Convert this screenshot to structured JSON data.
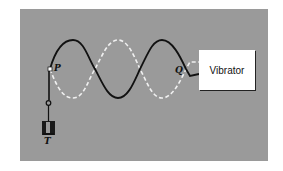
{
  "diagram": {
    "labels": {
      "p": "P",
      "q": "Q",
      "t": "T",
      "vibrator": "Vibrator"
    },
    "colors": {
      "background": "#9a9a9a",
      "string_solid": "#111111",
      "string_dashed": "#f2f2f2",
      "box": "#ffffff"
    },
    "wave": {
      "half_wavelengths": 3,
      "node_p": [
        50,
        69
      ],
      "node_q": [
        186,
        69
      ],
      "amplitude_px": 29
    }
  }
}
